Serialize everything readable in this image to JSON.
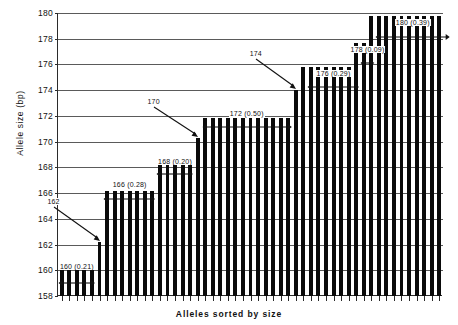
{
  "chart_data": {
    "type": "bar",
    "title": "",
    "xlabel": "Alleles sorted by size",
    "ylabel": "Allele size (bp)",
    "ylim": [
      158,
      180
    ],
    "ytick_labels": [
      "158",
      "160",
      "162",
      "164",
      "166",
      "168",
      "170",
      "172",
      "174",
      "176",
      "178",
      "180"
    ],
    "ytick_values": [
      158,
      160,
      162,
      164,
      166,
      168,
      170,
      172,
      174,
      176,
      178,
      180
    ],
    "grid": true,
    "legend": "none",
    "xtick_labels": [],
    "categories_note": "Alleles sorted by size (unlabeled individual alleles)",
    "bar_color": "#0a0a0a",
    "allele_groups": [
      {
        "size": 160,
        "frequency": 0.21,
        "count": 5,
        "label": "160  (0.21)"
      },
      {
        "size": 162,
        "frequency": null,
        "count": 1,
        "label": "162"
      },
      {
        "size": 166,
        "frequency": 0.28,
        "count": 7,
        "label": "166  (0.28)"
      },
      {
        "size": 168,
        "frequency": 0.2,
        "count": 5,
        "label": "168  (0.20)"
      },
      {
        "size": 170,
        "frequency": null,
        "count": 1,
        "label": "170"
      },
      {
        "size": 172,
        "frequency": 0.5,
        "count": 12,
        "label": "172  (0.50)"
      },
      {
        "size": 174,
        "frequency": null,
        "count": 1,
        "label": "174"
      },
      {
        "size": 176,
        "frequency": 0.29,
        "count": 7,
        "label": "176  (0.29)"
      },
      {
        "size": 178,
        "frequency": 0.09,
        "count": 2,
        "label": "178  (0.09)"
      },
      {
        "size": 180,
        "frequency": 0.39,
        "count": 10,
        "label": "180  (0.39)"
      }
    ],
    "values": [
      160.3,
      160.3,
      160.3,
      160.3,
      160.3,
      162.2,
      166.2,
      166.2,
      166.2,
      166.2,
      166.2,
      166.2,
      166.2,
      168.2,
      168.2,
      168.2,
      168.2,
      168.2,
      170.3,
      171.8,
      171.8,
      171.8,
      171.8,
      171.8,
      171.8,
      171.8,
      171.8,
      171.8,
      171.8,
      171.8,
      171.8,
      174.0,
      175.8,
      175.8,
      175.8,
      175.8,
      175.8,
      175.8,
      175.8,
      177.7,
      177.7,
      179.8,
      179.8,
      179.8,
      179.8,
      179.8,
      179.8,
      179.8,
      179.8,
      179.8,
      179.8
    ],
    "annotations": [
      {
        "id": "a160",
        "text": "160  (0.21)",
        "kind": "span-arrow"
      },
      {
        "id": "a162",
        "text": "162",
        "kind": "pointer"
      },
      {
        "id": "a166",
        "text": "166  (0.28)",
        "kind": "span-arrow"
      },
      {
        "id": "a168",
        "text": "168  (0.20)",
        "kind": "span-arrow"
      },
      {
        "id": "a170",
        "text": "170",
        "kind": "pointer"
      },
      {
        "id": "a172",
        "text": "172  (0.50)",
        "kind": "span-arrow"
      },
      {
        "id": "a174",
        "text": "174",
        "kind": "pointer"
      },
      {
        "id": "a176",
        "text": "176  (0.29)",
        "kind": "span-arrow"
      },
      {
        "id": "a178",
        "text": "178  (0.09)",
        "kind": "span-arrow"
      },
      {
        "id": "a180",
        "text": "180  (0.39)",
        "kind": "span-arrow"
      }
    ]
  }
}
